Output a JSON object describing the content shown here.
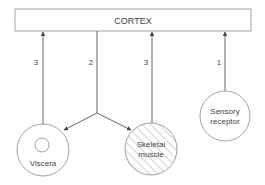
{
  "diagram": {
    "top_box": {
      "label": "CORTEX"
    },
    "nodes": [
      {
        "id": "viscera",
        "label_lines": [
          "Viscera"
        ]
      },
      {
        "id": "skeletal-muscle",
        "label_lines": [
          "Skeletal",
          "muscle"
        ]
      },
      {
        "id": "sensory-receptor",
        "label_lines": [
          "Sensory",
          "receptor"
        ]
      }
    ],
    "edges": [
      {
        "id": "viscera-to-cortex",
        "label": "3"
      },
      {
        "id": "cortex-to-effectors",
        "label": "2"
      },
      {
        "id": "skeletal-to-cortex",
        "label": "3"
      },
      {
        "id": "sensory-to-cortex",
        "label": "1"
      }
    ],
    "colors": {
      "stroke": "#555555",
      "box_fill": "#ffffff",
      "hatch": "#9a9a9a"
    }
  }
}
